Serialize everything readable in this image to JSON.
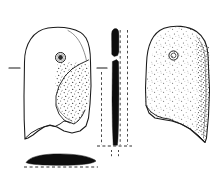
{
  "figure": {
    "domain": "archaeological-object-illustration",
    "title": "",
    "caption": "",
    "background_color": "#ffffff",
    "ink_color": "#1a1a1a",
    "fill_color": "#0d0d0d",
    "stipple_color": "#3a3a3a",
    "canvas": {
      "width": 223,
      "height": 179
    },
    "views": [
      {
        "id": "obverse-view",
        "label": "",
        "position": {
          "x": 18,
          "y": 26,
          "width": 78,
          "height": 114
        },
        "description": "front face outline, rounded top, perforation upper right, stippled facet on right side, irregular broken lower edge",
        "perforation": {
          "cx": 60.5,
          "cy": 57.5,
          "r_outer": 5.2,
          "r_inner": 2.4
        },
        "fill": "outline",
        "stipple": "partial"
      },
      {
        "id": "profile-view",
        "label": "",
        "position": {
          "x": 110,
          "y": 28,
          "width": 9,
          "height": 118
        },
        "description": "narrow side profile filled solid black with a gap at the perforation",
        "fill": "solid-black",
        "perforation_gap": {
          "y": 58,
          "height": 6
        }
      },
      {
        "id": "reverse-view",
        "label": "",
        "position": {
          "x": 143,
          "y": 26,
          "width": 68,
          "height": 118
        },
        "description": "reverse face, fully stippled, rounded top, perforation upper centre, broken lower edge sloping to a point at right",
        "perforation": {
          "cx": 173.5,
          "cy": 55.5,
          "r_outer": 4.6,
          "r_inner": 2.2
        },
        "fill": "stippled",
        "stipple": "full"
      },
      {
        "id": "section-view",
        "label": "",
        "position": {
          "x": 25,
          "y": 155,
          "width": 72,
          "height": 10
        },
        "description": "lens-shaped transverse cross-section, solid black, with dashed base line",
        "fill": "solid-black"
      }
    ],
    "registration_marks": [
      {
        "id": "tick-left",
        "x1": 9,
        "y1": 68,
        "x2": 20,
        "y2": 68,
        "orientation": "horizontal"
      },
      {
        "id": "tick-mid",
        "x1": 97,
        "y1": 68,
        "x2": 107,
        "y2": 68,
        "orientation": "horizontal"
      }
    ],
    "guides": [
      {
        "id": "dashed-guide-left",
        "x1": 101,
        "y1": 72,
        "x2": 101,
        "y2": 146,
        "style": "dashed",
        "orientation": "vertical"
      },
      {
        "id": "dashed-guide-right",
        "x1": 127,
        "y1": 28,
        "x2": 127,
        "y2": 146,
        "style": "dashed",
        "orientation": "vertical"
      },
      {
        "id": "dashed-guide-profile-inner",
        "x1": 119.5,
        "y1": 30,
        "x2": 119.5,
        "y2": 146,
        "style": "dashed",
        "orientation": "vertical"
      },
      {
        "id": "dashed-baseline-profile",
        "x1": 97,
        "y1": 146,
        "x2": 132,
        "y2": 146,
        "style": "dashed",
        "orientation": "horizontal"
      },
      {
        "id": "dashed-baseline-section",
        "x1": 24,
        "y1": 166,
        "x2": 98,
        "y2": 166,
        "style": "dashed",
        "orientation": "horizontal"
      },
      {
        "id": "dashed-drop-left",
        "x1": 111,
        "y1": 150,
        "x2": 111,
        "y2": 157,
        "style": "dashed",
        "orientation": "vertical"
      },
      {
        "id": "dashed-drop-right",
        "x1": 118,
        "y1": 150,
        "x2": 118,
        "y2": 157,
        "style": "dashed",
        "orientation": "vertical"
      }
    ],
    "scale_bar": null,
    "annotations": []
  }
}
